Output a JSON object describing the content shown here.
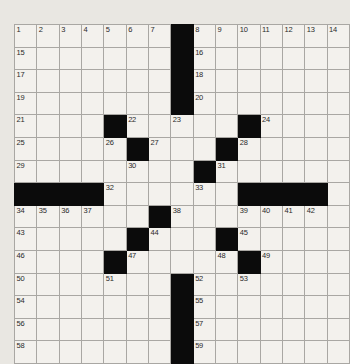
{
  "puzzle": {
    "type": "crossword-grid",
    "rows": 15,
    "cols": 15,
    "colors": {
      "page_background": "#e9e7e2",
      "cell_fill": "#f3f1ed",
      "block_fill": "#0b0b0b",
      "grid_line": "#a9a7a3",
      "number_text": "#2a2a2a"
    },
    "blocks": [
      [
        1,
        8
      ],
      [
        2,
        8
      ],
      [
        3,
        8
      ],
      [
        4,
        8
      ],
      [
        5,
        5
      ],
      [
        5,
        11
      ],
      [
        6,
        6
      ],
      [
        6,
        10
      ],
      [
        7,
        9
      ],
      [
        8,
        1
      ],
      [
        8,
        2
      ],
      [
        8,
        3
      ],
      [
        8,
        4
      ],
      [
        8,
        11
      ],
      [
        8,
        12
      ],
      [
        8,
        13
      ],
      [
        8,
        14
      ],
      [
        9,
        7
      ],
      [
        10,
        6
      ],
      [
        10,
        10
      ],
      [
        11,
        5
      ],
      [
        11,
        11
      ],
      [
        12,
        8
      ],
      [
        13,
        8
      ],
      [
        14,
        8
      ],
      [
        15,
        8
      ]
    ],
    "numbers": [
      {
        "row": 1,
        "col": 1,
        "n": "1"
      },
      {
        "row": 1,
        "col": 2,
        "n": "2"
      },
      {
        "row": 1,
        "col": 3,
        "n": "3"
      },
      {
        "row": 1,
        "col": 4,
        "n": "4"
      },
      {
        "row": 1,
        "col": 5,
        "n": "5"
      },
      {
        "row": 1,
        "col": 6,
        "n": "6"
      },
      {
        "row": 1,
        "col": 7,
        "n": "7"
      },
      {
        "row": 1,
        "col": 9,
        "n": "8"
      },
      {
        "row": 1,
        "col": 10,
        "n": "9"
      },
      {
        "row": 1,
        "col": 11,
        "n": "10"
      },
      {
        "row": 1,
        "col": 12,
        "n": "11"
      },
      {
        "row": 1,
        "col": 13,
        "n": "12"
      },
      {
        "row": 1,
        "col": 14,
        "n": "13"
      },
      {
        "row": 1,
        "col": 15,
        "n": "14"
      },
      {
        "row": 2,
        "col": 1,
        "n": "15"
      },
      {
        "row": 2,
        "col": 9,
        "n": "16"
      },
      {
        "row": 3,
        "col": 1,
        "n": "17"
      },
      {
        "row": 3,
        "col": 9,
        "n": "18"
      },
      {
        "row": 4,
        "col": 1,
        "n": "19"
      },
      {
        "row": 4,
        "col": 9,
        "n": "20"
      },
      {
        "row": 5,
        "col": 1,
        "n": "21"
      },
      {
        "row": 5,
        "col": 6,
        "n": "22"
      },
      {
        "row": 5,
        "col": 8,
        "n": "23"
      },
      {
        "row": 5,
        "col": 12,
        "n": "24"
      },
      {
        "row": 6,
        "col": 1,
        "n": "25"
      },
      {
        "row": 6,
        "col": 5,
        "n": "26"
      },
      {
        "row": 6,
        "col": 7,
        "n": "27"
      },
      {
        "row": 6,
        "col": 11,
        "n": "28"
      },
      {
        "row": 7,
        "col": 1,
        "n": "29"
      },
      {
        "row": 7,
        "col": 6,
        "n": "30"
      },
      {
        "row": 7,
        "col": 10,
        "n": "31"
      },
      {
        "row": 8,
        "col": 5,
        "n": "32"
      },
      {
        "row": 8,
        "col": 9,
        "n": "33"
      },
      {
        "row": 9,
        "col": 1,
        "n": "34"
      },
      {
        "row": 9,
        "col": 2,
        "n": "35"
      },
      {
        "row": 9,
        "col": 3,
        "n": "36"
      },
      {
        "row": 9,
        "col": 4,
        "n": "37"
      },
      {
        "row": 9,
        "col": 8,
        "n": "38"
      },
      {
        "row": 9,
        "col": 11,
        "n": "39"
      },
      {
        "row": 9,
        "col": 12,
        "n": "40"
      },
      {
        "row": 9,
        "col": 13,
        "n": "41"
      },
      {
        "row": 9,
        "col": 14,
        "n": "42"
      },
      {
        "row": 10,
        "col": 1,
        "n": "43"
      },
      {
        "row": 10,
        "col": 7,
        "n": "44"
      },
      {
        "row": 10,
        "col": 11,
        "n": "45"
      },
      {
        "row": 11,
        "col": 1,
        "n": "46"
      },
      {
        "row": 11,
        "col": 6,
        "n": "47"
      },
      {
        "row": 11,
        "col": 10,
        "n": "48"
      },
      {
        "row": 11,
        "col": 12,
        "n": "49"
      },
      {
        "row": 12,
        "col": 1,
        "n": "50"
      },
      {
        "row": 12,
        "col": 5,
        "n": "51"
      },
      {
        "row": 12,
        "col": 9,
        "n": "52"
      },
      {
        "row": 12,
        "col": 11,
        "n": "53"
      },
      {
        "row": 13,
        "col": 1,
        "n": "54"
      },
      {
        "row": 13,
        "col": 9,
        "n": "55"
      },
      {
        "row": 14,
        "col": 1,
        "n": "56"
      },
      {
        "row": 14,
        "col": 9,
        "n": "57"
      },
      {
        "row": 15,
        "col": 1,
        "n": "58"
      },
      {
        "row": 15,
        "col": 9,
        "n": "59"
      }
    ],
    "entries": []
  }
}
